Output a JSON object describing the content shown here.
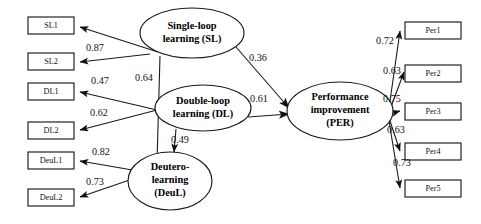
{
  "diagram": {
    "type": "structural-equation-model-path-diagram",
    "title": "",
    "background_color": "#ffffff",
    "stroke_color": "#1a1a1a",
    "latent_variables": [
      {
        "id": "SL",
        "lines": [
          "Single-loop",
          "learning (SL)"
        ],
        "cx": 192,
        "cy": 33,
        "rx": 52,
        "ry": 25
      },
      {
        "id": "DL",
        "lines": [
          "Double-loop",
          "learning (DL)"
        ],
        "cx": 203,
        "cy": 108,
        "rx": 48,
        "ry": 23
      },
      {
        "id": "DeuL",
        "lines": [
          "Deutero-",
          "learning",
          "(DeuL)"
        ],
        "cx": 170,
        "cy": 181,
        "rx": 42,
        "ry": 29
      },
      {
        "id": "PER",
        "lines": [
          "Performance",
          "improvement",
          "(PER)"
        ],
        "cx": 340,
        "cy": 111,
        "rx": 53,
        "ry": 29
      }
    ],
    "observed_variables": [
      {
        "id": "SL1",
        "label": "SL1",
        "x": 28,
        "y": 17,
        "w": 46,
        "h": 17
      },
      {
        "id": "SL2",
        "label": "SL2",
        "x": 28,
        "y": 53,
        "w": 46,
        "h": 17
      },
      {
        "id": "DL1",
        "label": "DL1",
        "x": 28,
        "y": 83,
        "w": 46,
        "h": 17
      },
      {
        "id": "DL2",
        "label": "DL2",
        "x": 28,
        "y": 122,
        "w": 46,
        "h": 17
      },
      {
        "id": "DeuL1",
        "label": "DeuL1",
        "x": 28,
        "y": 152,
        "w": 46,
        "h": 17
      },
      {
        "id": "DeuL2",
        "label": "DeuL2",
        "x": 28,
        "y": 189,
        "w": 46,
        "h": 17
      },
      {
        "id": "Per1",
        "label": "Per1",
        "x": 405,
        "y": 22,
        "w": 56,
        "h": 17
      },
      {
        "id": "Per2",
        "label": "Per2",
        "x": 405,
        "y": 65,
        "w": 56,
        "h": 17
      },
      {
        "id": "Per3",
        "label": "Per3",
        "x": 405,
        "y": 103,
        "w": 56,
        "h": 17
      },
      {
        "id": "Per4",
        "label": "Per4",
        "x": 405,
        "y": 143,
        "w": 56,
        "h": 17
      },
      {
        "id": "Per5",
        "label": "Per5",
        "x": 405,
        "y": 180,
        "w": 56,
        "h": 17
      }
    ],
    "paths": [
      {
        "id": "sl-to-sl1",
        "from": "SL",
        "to": "SL1",
        "coefficient": "",
        "kind": "measurement"
      },
      {
        "id": "sl-to-sl2",
        "from": "SL",
        "to": "SL2",
        "coefficient": "0.87",
        "kind": "measurement",
        "label_x": 95,
        "label_y": 49
      },
      {
        "id": "dl-to-dl1",
        "from": "DL",
        "to": "DL1",
        "coefficient": "0.47",
        "kind": "measurement",
        "label_x": 100,
        "label_y": 82
      },
      {
        "id": "dl-to-dl2",
        "from": "DL",
        "to": "DL2",
        "coefficient": "0.62",
        "kind": "measurement",
        "label_x": 99,
        "label_y": 114
      },
      {
        "id": "deul-to-deul1",
        "from": "DeuL",
        "to": "DeuL1",
        "coefficient": "0.82",
        "kind": "measurement",
        "label_x": 101,
        "label_y": 153
      },
      {
        "id": "deul-to-deul2",
        "from": "DeuL",
        "to": "DeuL2",
        "coefficient": "0.73",
        "kind": "measurement",
        "label_x": 95,
        "label_y": 183
      },
      {
        "id": "per-to-per1",
        "from": "PER",
        "to": "Per1",
        "coefficient": "0.72",
        "kind": "measurement",
        "label_x": 385,
        "label_y": 42
      },
      {
        "id": "per-to-per2",
        "from": "PER",
        "to": "Per2",
        "coefficient": "0.63",
        "kind": "measurement",
        "label_x": 392,
        "label_y": 72
      },
      {
        "id": "per-to-per3",
        "from": "PER",
        "to": "Per3",
        "coefficient": "0.75",
        "kind": "measurement",
        "label_x": 392,
        "label_y": 100
      },
      {
        "id": "per-to-per4",
        "from": "PER",
        "to": "Per4",
        "coefficient": "0.63",
        "kind": "measurement",
        "label_x": 396,
        "label_y": 131
      },
      {
        "id": "per-to-per5",
        "from": "PER",
        "to": "Per5",
        "coefficient": "0.73",
        "kind": "measurement",
        "label_x": 402,
        "label_y": 164
      },
      {
        "id": "sl-to-per",
        "from": "SL",
        "to": "PER",
        "coefficient": "0.36",
        "kind": "structural",
        "label_x": 258,
        "label_y": 59
      },
      {
        "id": "dl-to-per",
        "from": "DL",
        "to": "PER",
        "coefficient": "0.61",
        "kind": "structural",
        "label_x": 259,
        "label_y": 100
      },
      {
        "id": "sl-to-deul",
        "from": "SL",
        "to": "DeuL",
        "coefficient": "0.64",
        "kind": "structural",
        "label_x": 144,
        "label_y": 79
      },
      {
        "id": "dl-to-deul",
        "from": "DL",
        "to": "DeuL",
        "coefficient": "0.49",
        "kind": "structural",
        "label_x": 180,
        "label_y": 141
      }
    ]
  }
}
